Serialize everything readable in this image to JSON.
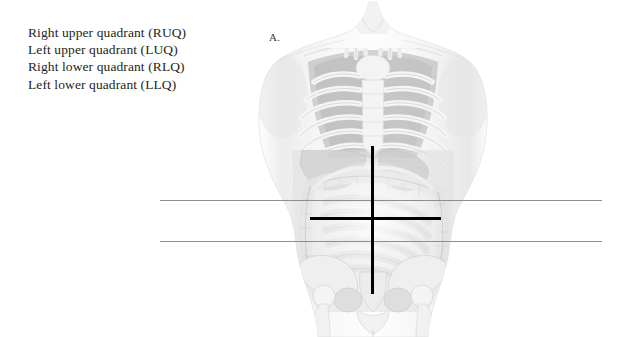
{
  "canvas": {
    "width": 631,
    "height": 337,
    "background": "#ffffff"
  },
  "legend": {
    "lines": [
      "Right upper quadrant (RUQ)",
      "Left upper quadrant (LUQ)",
      "Right lower quadrant (RLQ)",
      "Left lower quadrant (LLQ)"
    ]
  },
  "panel": {
    "letter": "A."
  },
  "figure": {
    "name": "anterior-torso-anatomy",
    "regions": [
      "rib-cage",
      "sternum",
      "clavicle",
      "liver",
      "stomach",
      "transverse-colon",
      "ascending-colon",
      "descending-colon",
      "small-intestine",
      "pelvis",
      "femur-head"
    ]
  },
  "overlay": {
    "vertical_axis": {
      "label": "median-plane",
      "color": "#000000"
    },
    "horizontal_axis": {
      "label": "transumbilical-plane",
      "color": "#000000"
    },
    "thin_rules": [
      {
        "label": "subcostal-plane-guide",
        "color": "#8e8e8e"
      },
      {
        "label": "intertubercular-plane-guide",
        "color": "#8e8e8e"
      }
    ]
  }
}
